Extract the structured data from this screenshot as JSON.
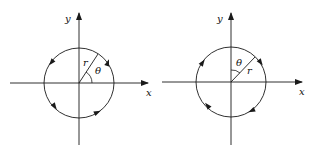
{
  "diagrams": [
    {
      "id": "left",
      "orientation": "counterclockwise",
      "angle_reference": "x-axis",
      "labels": {
        "x": "x",
        "y": "y",
        "r": "r",
        "theta": "θ"
      }
    },
    {
      "id": "right",
      "orientation": "clockwise",
      "angle_reference": "y-axis",
      "labels": {
        "x": "x",
        "y": "y",
        "r": "r",
        "theta": "θ"
      }
    }
  ],
  "colors": {
    "stroke": "#1a1a1a",
    "background": "#ffffff"
  }
}
